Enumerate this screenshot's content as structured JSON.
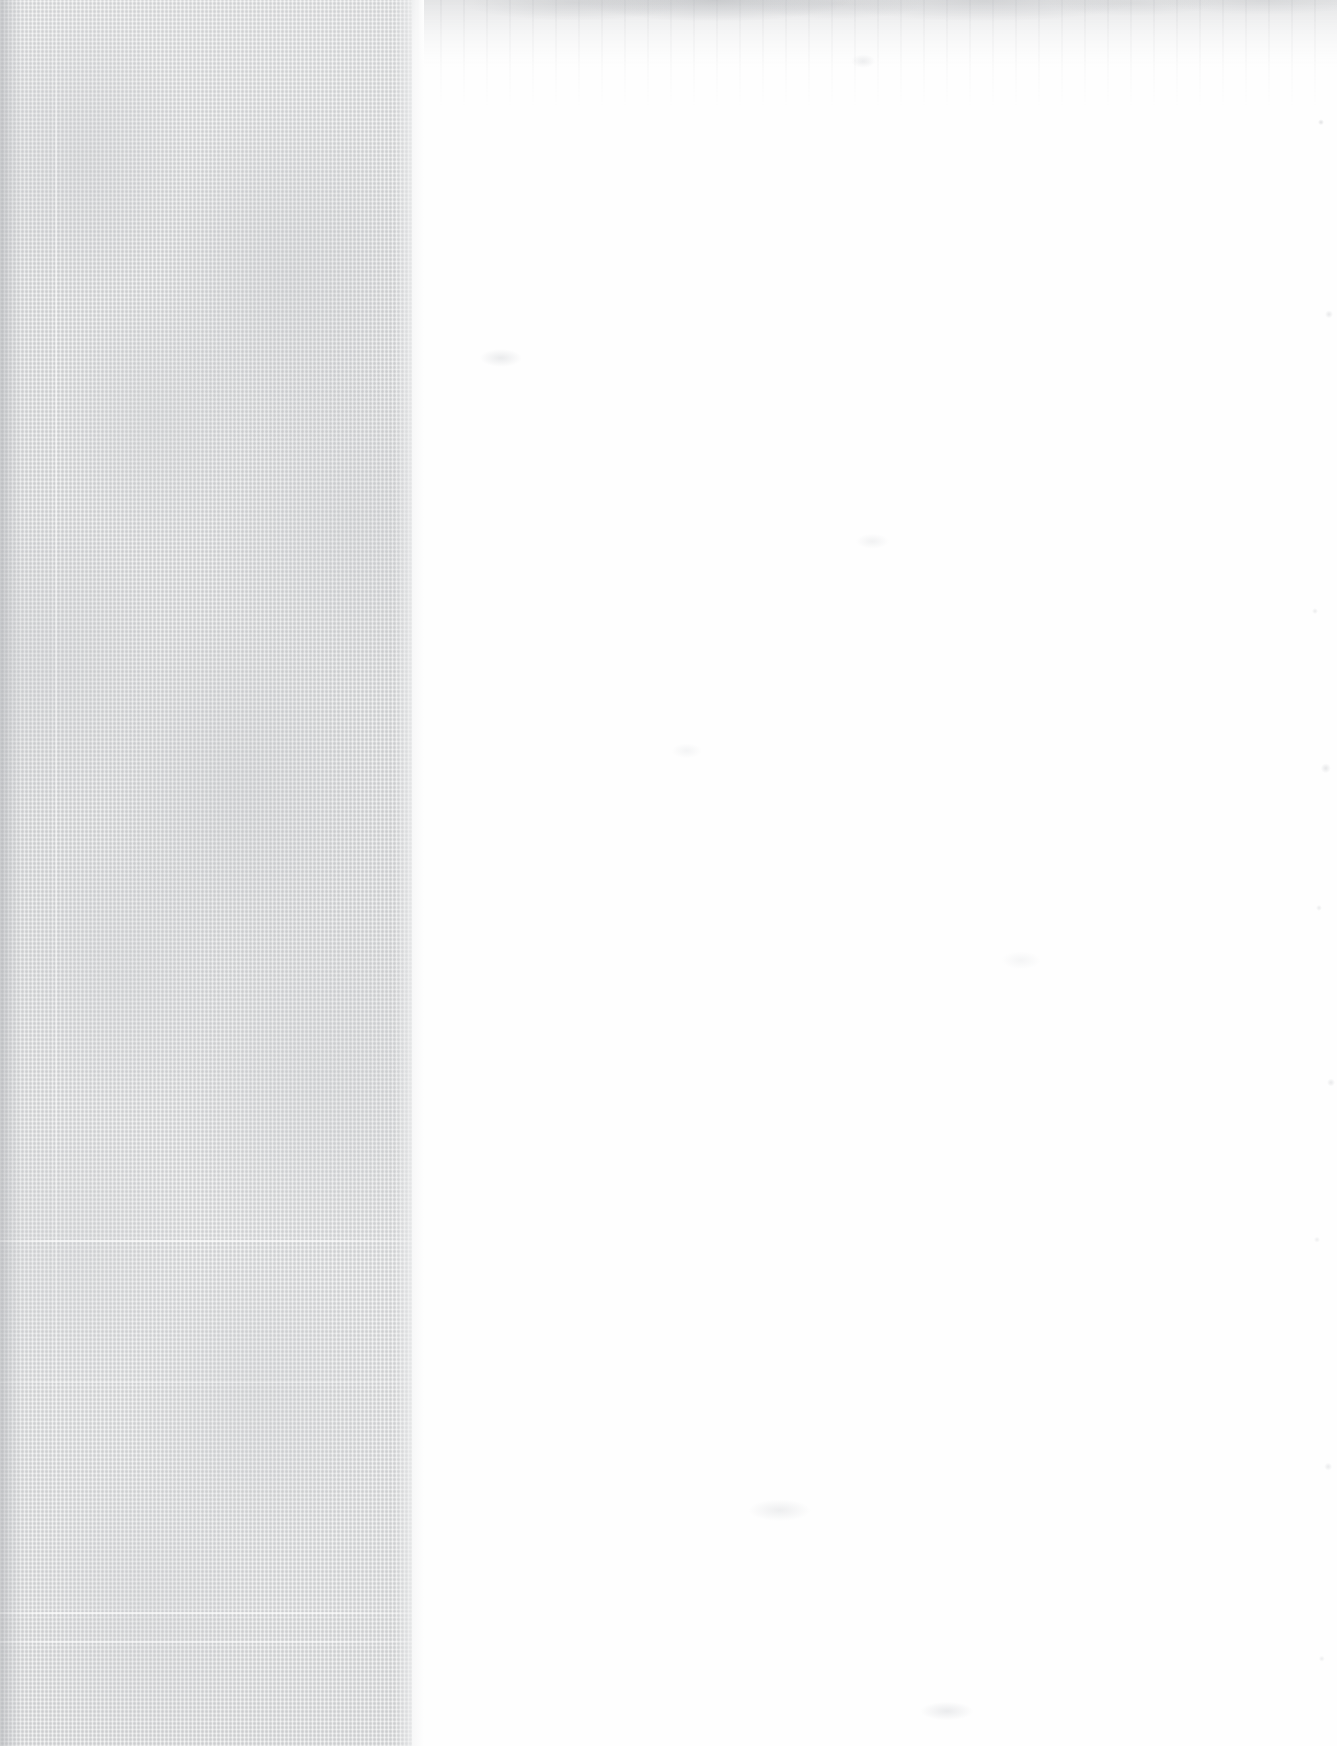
{
  "document": {
    "kind": "scanned-page",
    "title": "",
    "body_text": "",
    "page_number": "",
    "visible_text_present": false
  },
  "canvas": {
    "width_px": 1337,
    "height_px": 1746
  },
  "regions": {
    "left_band": {
      "name": "gutter-texture-band",
      "x_px": 0,
      "y_px": 0,
      "width_px": 412,
      "height_px": 1746,
      "base_color": "#dadbdc",
      "edge_color": "#d0d1d3",
      "texture": "linen-weave",
      "label": ""
    },
    "right_page": {
      "name": "blank-paper-field",
      "x_px": 412,
      "y_px": 0,
      "width_px": 925,
      "height_px": 1746,
      "base_color": "#fefefe",
      "label": ""
    }
  },
  "marks": {
    "vertical_rules": [
      {
        "name": "margin-ghost-rule",
        "x_px": 55,
        "color": "#e8e9ea"
      }
    ],
    "horizontal_rules": [
      {
        "name": "fold-crease-upper",
        "y_px": 1240,
        "height_px": 2,
        "color": "#e6e7e8"
      },
      {
        "name": "fold-crease-mid",
        "y_px": 1382,
        "height_px": 1,
        "color": "#e4e5e6"
      },
      {
        "name": "fold-crease-lower",
        "y_px": 1612,
        "height_px": 2,
        "color": "#e9eaeb"
      },
      {
        "name": "fold-crease-bottom",
        "y_px": 1641,
        "height_px": 2,
        "color": "#e7e8e9"
      }
    ],
    "top_edge_wash": {
      "name": "scan-shadow-top",
      "y_px": 0,
      "height_px": 110,
      "color": "#acaeb2"
    }
  },
  "colors": {
    "band_base": "#dadbdc",
    "band_gutter": "#b0b2b6",
    "paper_white": "#fefefe",
    "rule_light": "#ffffff",
    "smudge_gray": "#acaeb2"
  }
}
